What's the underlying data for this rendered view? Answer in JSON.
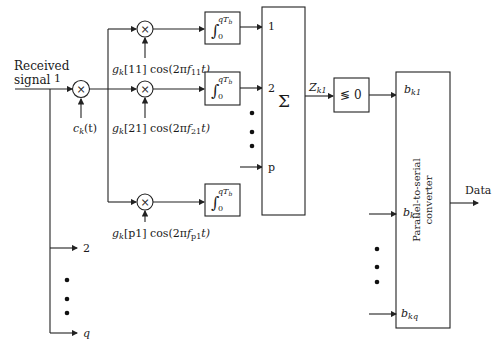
{
  "diagram": {
    "input": {
      "label_line1": "Received",
      "label_line2": "signal",
      "branch_labels": [
        "1",
        "2",
        "q"
      ]
    },
    "spreading": {
      "label": "c",
      "sub": "k",
      "arg": "(t)"
    },
    "multiplier_symbol": "×",
    "carriers": [
      {
        "g": "g",
        "gsub": "k",
        "idx": "[11]",
        "cos": " cos(2π",
        "f": "f",
        "fsub": "11",
        "tail": "t)"
      },
      {
        "g": "g",
        "gsub": "k",
        "idx": "[21]",
        "cos": " cos(2π",
        "f": "f",
        "fsub": "21",
        "tail": "t)"
      },
      {
        "g": "g",
        "gsub": "k",
        "idx": "[p1]",
        "cos": " cos(2π",
        "f": "f",
        "fsub": "p1",
        "tail": "t)"
      }
    ],
    "integrator": {
      "symbol": "∫",
      "lower": "0",
      "upper": "qT",
      "upper_sub": "b"
    },
    "sum": {
      "symbol": "Σ",
      "input_labels": [
        "1",
        "2",
        "p"
      ]
    },
    "decision": {
      "output": "Z",
      "output_sub": "k1",
      "label": "≶ 0"
    },
    "converter": {
      "line1": "Parallel-to-serial",
      "line2": "converter",
      "inputs": [
        {
          "b": "b",
          "sub": "k1"
        },
        {
          "b": "b",
          "sub": "k2"
        },
        {
          "b": "b",
          "sub": "kq"
        }
      ],
      "output": "Data"
    }
  }
}
